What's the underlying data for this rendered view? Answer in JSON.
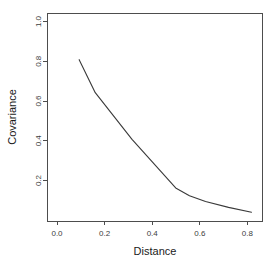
{
  "chart_data": {
    "type": "line",
    "title": "",
    "xlabel": "Distance",
    "ylabel": "Covariance",
    "xlim": [
      -0.04,
      0.9
    ],
    "ylim": [
      0.0,
      1.07
    ],
    "grid": false,
    "legend": null,
    "xticks": [
      "0.0",
      "0.2",
      "0.4",
      "0.6",
      "0.8"
    ],
    "xtick_values": [
      0.0,
      0.2,
      0.4,
      0.6,
      0.8
    ],
    "yticks": [
      "0.2",
      "0.4",
      "0.6",
      "0.8",
      "1.0"
    ],
    "ytick_values": [
      0.2,
      0.4,
      0.6,
      0.8,
      1.0
    ],
    "series": [
      {
        "name": "empirical covariance",
        "x": [
          0.1,
          0.17,
          0.33,
          0.52,
          0.58,
          0.65,
          0.75,
          0.85
        ],
        "y": [
          0.83,
          0.66,
          0.42,
          0.17,
          0.13,
          0.1,
          0.07,
          0.045
        ]
      }
    ],
    "line_color": "#3a3a3a",
    "axis_color": "#4d4d4d",
    "background_color": "#ffffff"
  },
  "labels": {
    "x_axis_title": "Distance",
    "y_axis_title": "Covariance"
  }
}
